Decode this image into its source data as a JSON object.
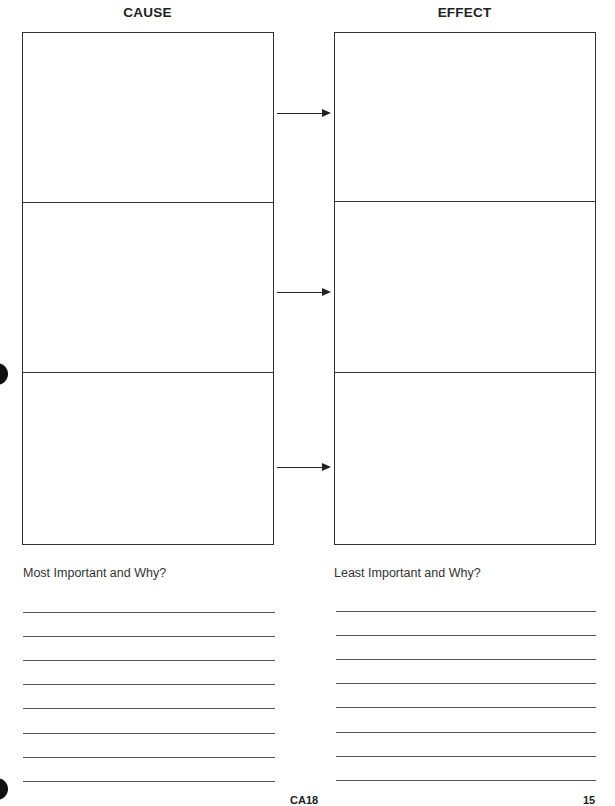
{
  "cause": {
    "heading": "CAUSE",
    "rows": 3
  },
  "effect": {
    "heading": "EFFECT",
    "rows": 3
  },
  "arrows": 3,
  "prompts": {
    "most_important": "Most Important and Why?",
    "least_important": "Least Important and Why?"
  },
  "answer_lines_per_column": 8,
  "footer": {
    "code": "CA18",
    "page": "15"
  }
}
